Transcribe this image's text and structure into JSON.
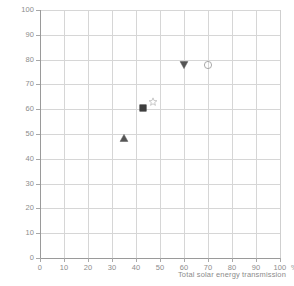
{
  "chart_data": {
    "type": "scatter",
    "title": "",
    "subtitle": "",
    "xlabel": "Total solar energy transmission",
    "ylabel": "",
    "x_unit": "%",
    "xlim": [
      0,
      100
    ],
    "ylim": [
      0,
      100
    ],
    "xticks": [
      0,
      10,
      20,
      30,
      40,
      50,
      60,
      70,
      80,
      90,
      100
    ],
    "yticks": [
      0,
      10,
      20,
      30,
      40,
      50,
      60,
      70,
      80,
      90,
      100
    ],
    "xtick_labels": [
      "0",
      "10",
      "20",
      "30",
      "40",
      "50",
      "60",
      "70",
      "80",
      "90",
      "100"
    ],
    "ytick_labels": [
      "0",
      "10",
      "20",
      "30",
      "40",
      "50",
      "60",
      "70",
      "80",
      "90",
      "100"
    ],
    "grid": true,
    "grid_color": "#d6d6d6",
    "axis_color": "#9a9a9a",
    "label_color": "#8c8c8c",
    "legend": "none",
    "points": [
      {
        "name": "triangle-up-marker",
        "shape": "triangle-up",
        "x": 35,
        "y": 48.5,
        "filled": true,
        "color": "#555555"
      },
      {
        "name": "square-marker",
        "shape": "square",
        "x": 43,
        "y": 60.5,
        "filled": true,
        "color": "#3f3f3f"
      },
      {
        "name": "star-marker",
        "shape": "star",
        "x": 47,
        "y": 63.0,
        "filled": false,
        "color": "#c2c2c2"
      },
      {
        "name": "triangle-down-marker",
        "shape": "triangle-down",
        "x": 60,
        "y": 78.0,
        "filled": true,
        "color": "#555555"
      },
      {
        "name": "circle-marker",
        "shape": "circle",
        "x": 70,
        "y": 78.0,
        "filled": false,
        "color": "#a0a0a0"
      }
    ]
  }
}
